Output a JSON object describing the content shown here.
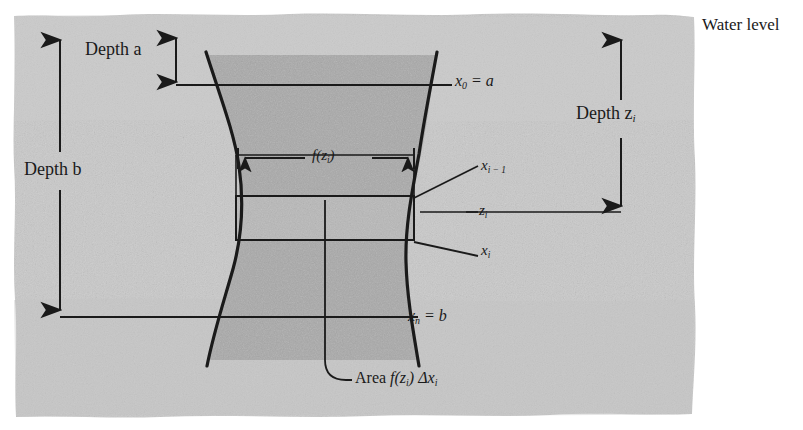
{
  "figure": {
    "caption_labels": {
      "water_level": "Water level",
      "depth_a": "Depth a",
      "depth_b": "Depth b",
      "depth_zi": "Depth z",
      "depth_zi_sub": "i",
      "x0_eq_a": "x",
      "x0_sub": "0",
      "x0_rest": " = a",
      "xn_eq_b": "x",
      "xn_sub": "n",
      "xn_rest": " = b",
      "f_of_zi": "f(z",
      "f_of_zi_sub": "i",
      "f_of_zi_close": ")",
      "x_i_minus_1": "x",
      "x_i_minus_1_sub": "i − 1",
      "z_i": "z",
      "z_i_sub": "i",
      "x_i": "x",
      "x_i_sub": "i",
      "area_prefix": "Area ",
      "area_f": "f(z",
      "area_f_sub": "i",
      "area_f_close": ") ",
      "area_delta": "Δx",
      "area_delta_sub": "i"
    },
    "colors": {
      "page_background": "#ffffff",
      "paper_background": "#c9c9c9",
      "plate_fill": "#aaaaaa",
      "strip_fill": "#b4b4b4",
      "ink": "#1a1a1a"
    },
    "geometry": {
      "paper": {
        "x": 13,
        "y": 14,
        "width": 683,
        "height": 404
      },
      "depth_b_arrow": {
        "x": 60,
        "y_top": 32,
        "y_bottom": 317
      },
      "depth_a_arrow": {
        "x": 176,
        "y_top": 32,
        "y_bottom": 85
      },
      "depth_zi_arrow": {
        "x": 621,
        "y_top": 33,
        "y_bottom": 213
      },
      "top_line_a": {
        "y": 85,
        "x_start": 176,
        "x_end": 452
      },
      "bottom_line_b": {
        "y": 317,
        "x_start": 60,
        "x_end": 418
      },
      "zi_line": {
        "y": 212,
        "x_start": 420,
        "x_end": 621
      },
      "strip_rect": {
        "x": 236,
        "y": 196,
        "width": 178,
        "height": 44
      },
      "measure_rect": {
        "x": 236,
        "y": 155,
        "width": 178,
        "height": 85
      },
      "fzi_arrow": {
        "y": 158,
        "x_start": 238,
        "x_end": 412
      },
      "leader_area": {
        "from_x": 325,
        "from_y": 200,
        "to_x": 357,
        "to_y": 380
      }
    },
    "annotations": [
      {
        "name": "water-level",
        "text": "Water level"
      },
      {
        "name": "depth-a",
        "text": "Depth a"
      },
      {
        "name": "depth-b",
        "text": "Depth b"
      },
      {
        "name": "depth-zi",
        "text": "Depth z_i"
      },
      {
        "name": "x0-eq-a",
        "text": "x_0 = a"
      },
      {
        "name": "xn-eq-b",
        "text": "x_n = b"
      },
      {
        "name": "fzi",
        "text": "f(z_i)"
      },
      {
        "name": "x-i-minus-1",
        "text": "x_{i-1}"
      },
      {
        "name": "zi",
        "text": "z_i"
      },
      {
        "name": "xi",
        "text": "x_i"
      },
      {
        "name": "area",
        "text": "Area f(z_i) Δx_i"
      }
    ]
  }
}
